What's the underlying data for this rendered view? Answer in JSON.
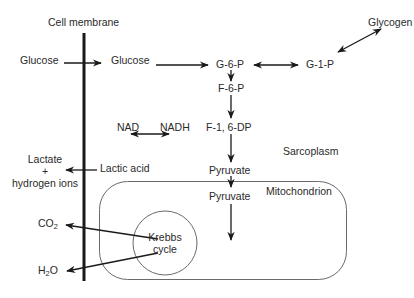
{
  "diagram": {
    "title_fragment": "",
    "regions": {
      "cell_membrane": "Cell membrane",
      "sarcoplasm": "Sarcoplasm",
      "mitochondrion": "Mitochondrion"
    },
    "nodes": {
      "glucose_outside": "Glucose",
      "glucose_inside": "Glucose",
      "g6p": "G-6-P",
      "g1p": "G-1-P",
      "glycogen": "Glycogen",
      "f6p": "F-6-P",
      "f16dp": "F-1, 6-DP",
      "nad": "NAD",
      "nadh": "NADH",
      "pyruvate_sarcoplasm": "Pyruvate",
      "pyruvate_mito": "Pyruvate",
      "krebbs_line1": "Krebbs",
      "krebbs_line2": "cycle",
      "lactic_acid": "Lactic acid",
      "lactate_line1": "Lactate",
      "lactate_line2": "+",
      "lactate_line3": "hydrogen ions",
      "co2_main": "CO",
      "co2_sub": "2",
      "h2o_h": "H",
      "h2o_sub": "2",
      "h2o_o": "O"
    },
    "edges": [
      {
        "from": "Glucose (outside)",
        "to": "Glucose (inside)",
        "type": "arrow"
      },
      {
        "from": "Glucose (inside)",
        "to": "G-6-P",
        "type": "arrow"
      },
      {
        "from": "G-6-P",
        "to": "G-1-P",
        "type": "double-arrow"
      },
      {
        "from": "G-1-P",
        "to": "Glycogen",
        "type": "double-arrow"
      },
      {
        "from": "G-6-P",
        "to": "F-6-P",
        "type": "arrow"
      },
      {
        "from": "F-6-P",
        "to": "F-1, 6-DP",
        "type": "arrow"
      },
      {
        "from": "F-1, 6-DP",
        "to": "Pyruvate",
        "type": "arrow"
      },
      {
        "from": "NAD",
        "to": "NADH",
        "type": "double-arrow"
      },
      {
        "from": "Pyruvate",
        "to": "Pyruvate (mitochondrion)",
        "type": "arrow"
      },
      {
        "from": "Pyruvate (mitochondrion)",
        "to": "Krebbs cycle",
        "type": "arrow"
      },
      {
        "from": "Lactic acid",
        "to": "Lactate + hydrogen ions",
        "type": "arrow"
      },
      {
        "from": "Krebbs cycle",
        "to": "CO2",
        "type": "arrow"
      },
      {
        "from": "Krebbs cycle",
        "to": "H2O",
        "type": "arrow"
      }
    ],
    "colors": {
      "line": "#1a1a1a",
      "thin_line": "#6a6a6a",
      "text": "#2a2a2a"
    }
  }
}
